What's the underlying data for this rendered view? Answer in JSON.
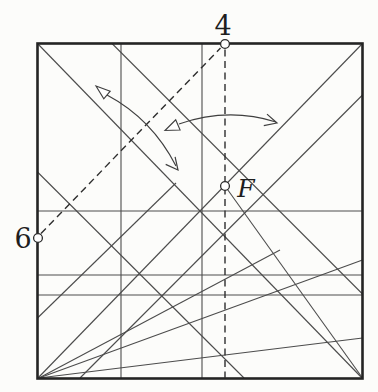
{
  "figure": {
    "description_labels": {
      "point_top": "4",
      "point_left": "6",
      "point_center": "F"
    },
    "colors": {
      "background": "#fcfcfa",
      "border": "#242424",
      "crease": "#4c4c4c",
      "dashed": "#2e2e2e",
      "arrow": "#3f3f3f",
      "label": "#1e1e1e",
      "circle_fill": "#ffffff",
      "circle_stroke": "#2b2b2b"
    },
    "square": {
      "x": 37.5,
      "y": 43.5,
      "w": 325,
      "h": 335,
      "stroke_width": 2.6
    },
    "creases": [
      {
        "name": "main-diagonal-crease",
        "x1": 37.5,
        "y1": 43.5,
        "x2": 362.5,
        "y2": 378.5
      },
      {
        "name": "anti-diagonal-crease",
        "x1": 37.5,
        "y1": 378.5,
        "x2": 362.5,
        "y2": 43.5
      },
      {
        "name": "vertical-center-crease",
        "x1": 202,
        "y1": 43.5,
        "x2": 202,
        "y2": 378.5
      },
      {
        "name": "vertical-quarter-crease",
        "x1": 121,
        "y1": 43.5,
        "x2": 121,
        "y2": 378.5
      },
      {
        "name": "horizontal-center-crease",
        "x1": 37.5,
        "y1": 211,
        "x2": 362.5,
        "y2": 211
      },
      {
        "name": "horizontal-lower-crease-1",
        "x1": 37.5,
        "y1": 275,
        "x2": 362.5,
        "y2": 275
      },
      {
        "name": "horizontal-lower-crease-2",
        "x1": 37.5,
        "y1": 295,
        "x2": 362.5,
        "y2": 295
      },
      {
        "name": "corner-fan-crease-steep",
        "x1": 39,
        "y1": 378,
        "x2": 280,
        "y2": 250
      },
      {
        "name": "corner-fan-crease-mid",
        "x1": 39,
        "y1": 378,
        "x2": 362.5,
        "y2": 260
      },
      {
        "name": "corner-fan-crease-shallow",
        "x1": 39,
        "y1": 378,
        "x2": 362.5,
        "y2": 338
      },
      {
        "name": "left-edge-slant-crease",
        "x1": 37.5,
        "y1": 172,
        "x2": 244,
        "y2": 378
      },
      {
        "name": "top-edge-slant-crease",
        "x1": 112,
        "y1": 43.5,
        "x2": 362.5,
        "y2": 294
      },
      {
        "name": "right-edge-steep-crease",
        "x1": 362.5,
        "y1": 95,
        "x2": 80,
        "y2": 378
      },
      {
        "name": "f-to-corner-crease",
        "x1": 225,
        "y1": 186,
        "x2": 362.5,
        "y2": 378
      },
      {
        "name": "short-left-slant-crease",
        "x1": 37.5,
        "y1": 318,
        "x2": 176,
        "y2": 183
      }
    ],
    "dashed_lines": [
      {
        "name": "fold-line-6-to-4",
        "x1": 41,
        "y1": 233.5,
        "x2": 220.5,
        "y2": 48
      },
      {
        "name": "fold-line-4-to-bottom",
        "x1": 225,
        "y1": 49.5,
        "x2": 225,
        "y2": 378
      }
    ],
    "point_markers": [
      {
        "name": "point-4-marker",
        "cx": 225,
        "cy": 44,
        "r": 4.4
      },
      {
        "name": "point-6-marker",
        "cx": 38,
        "cy": 238,
        "r": 4.4
      },
      {
        "name": "point-f-marker",
        "cx": 225,
        "cy": 186,
        "r": 4.4
      }
    ],
    "labels": [
      {
        "name": "point-4-label",
        "bind": "point_top",
        "x": 223,
        "y": 35,
        "size": 27,
        "italic": false
      },
      {
        "name": "point-6-label",
        "bind": "point_left",
        "x": 23,
        "y": 248,
        "size": 27,
        "italic": false
      },
      {
        "name": "point-f-label",
        "bind": "point_center",
        "x": 246,
        "y": 197,
        "size": 25,
        "italic": true
      }
    ],
    "arrows": [
      {
        "name": "fold-unfold-arrow-diagonal",
        "shaft": "M107,95 Q152,119 176,166",
        "hollow_head": "96,86 110.2,91.2 103.8,98.9",
        "v_head": "165.7,164.4 178,170 175.1,156.8"
      },
      {
        "name": "fold-unfold-arrow-horizontal",
        "shaft": "M179,124 Q228,107 276,122",
        "hollow_head": "165,130.5 175.7,119.8 180.1,130",
        "v_head": "263.8,125.7 277,123 267,114.1"
      }
    ]
  }
}
